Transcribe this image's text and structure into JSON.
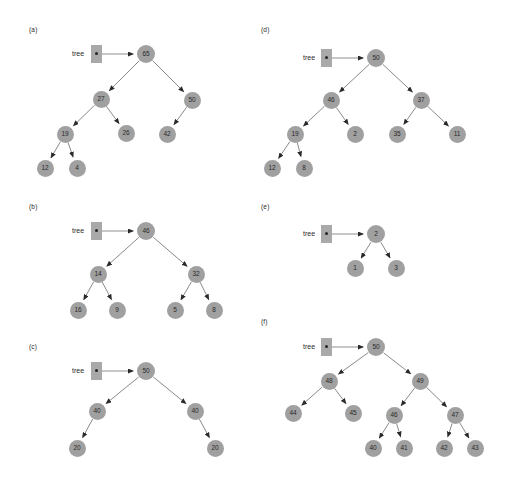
{
  "figure": {
    "background_color": "#ffffff",
    "node_color": "#a0a0a0",
    "node_text_color": "#2a2a2a",
    "edge_color": "#8a8a8a",
    "pointer_box_color": "#a9a9a9",
    "pointer_label": "tree"
  },
  "panels": [
    {
      "label": "(a)",
      "label_pos": [
        29,
        26
      ],
      "pointer": {
        "label": "tree",
        "label_pos": [
          72,
          50
        ],
        "box": [
          91,
          45,
          11,
          18
        ],
        "dot": [
          95,
          52
        ],
        "arrow_from": [
          102,
          54
        ],
        "arrow_to": [
          133,
          54
        ]
      },
      "nodes": [
        {
          "value": "65",
          "x": 146,
          "y": 54,
          "r": 9
        },
        {
          "value": "27",
          "x": 101,
          "y": 99,
          "r": 8.5
        },
        {
          "value": "50",
          "x": 192,
          "y": 100,
          "r": 8.5
        },
        {
          "value": "19",
          "x": 65,
          "y": 134,
          "r": 8.5
        },
        {
          "value": "26",
          "x": 126,
          "y": 133,
          "r": 8.5
        },
        {
          "value": "42",
          "x": 167,
          "y": 134,
          "r": 8.5
        },
        {
          "value": "12",
          "x": 45,
          "y": 168,
          "r": 8.5
        },
        {
          "value": "4",
          "x": 77,
          "y": 168,
          "r": 8.5
        }
      ],
      "edges": [
        [
          "65",
          "27"
        ],
        [
          "65",
          "50"
        ],
        [
          "27",
          "19"
        ],
        [
          "27",
          "26"
        ],
        [
          "50",
          "42"
        ],
        [
          "19",
          "12"
        ],
        [
          "19",
          "4"
        ]
      ]
    },
    {
      "label": "(b)",
      "label_pos": [
        29,
        203
      ],
      "pointer": {
        "label": "tree",
        "label_pos": [
          72,
          227
        ],
        "box": [
          91,
          222,
          11,
          18
        ],
        "dot": [
          95,
          229
        ],
        "arrow_from": [
          102,
          231
        ],
        "arrow_to": [
          133,
          231
        ]
      },
      "nodes": [
        {
          "value": "46",
          "x": 146,
          "y": 231,
          "r": 9
        },
        {
          "value": "14",
          "x": 98,
          "y": 274,
          "r": 8.5
        },
        {
          "value": "32",
          "x": 196,
          "y": 274,
          "r": 8.5
        },
        {
          "value": "16",
          "x": 78,
          "y": 310,
          "r": 8.5
        },
        {
          "value": "9",
          "x": 117,
          "y": 310,
          "r": 8.5
        },
        {
          "value": "5",
          "x": 175,
          "y": 310,
          "r": 8.5
        },
        {
          "value": "8",
          "x": 214,
          "y": 310,
          "r": 8.5
        }
      ],
      "edges": [
        [
          "46",
          "14"
        ],
        [
          "46",
          "32"
        ],
        [
          "14",
          "16"
        ],
        [
          "14",
          "9"
        ],
        [
          "32",
          "5"
        ],
        [
          "32",
          "8"
        ]
      ]
    },
    {
      "label": "(c)",
      "label_pos": [
        29,
        343
      ],
      "pointer": {
        "label": "tree",
        "label_pos": [
          72,
          367
        ],
        "box": [
          91,
          362,
          11,
          18
        ],
        "dot": [
          95,
          369
        ],
        "arrow_from": [
          102,
          371
        ],
        "arrow_to": [
          133,
          371
        ]
      },
      "nodes": [
        {
          "value": "50",
          "x": 146,
          "y": 371,
          "r": 9
        },
        {
          "value": "40",
          "x": 97,
          "y": 411,
          "r": 8.5
        },
        {
          "value": "40",
          "x": 195,
          "y": 411,
          "r": 8.5
        },
        {
          "value": "20",
          "x": 77,
          "y": 448,
          "r": 8.5
        },
        {
          "value": "20",
          "x": 215,
          "y": 448,
          "r": 8.5
        }
      ],
      "edges": [
        [
          "50",
          "40L"
        ],
        [
          "50",
          "40R"
        ],
        [
          "40L",
          "20L"
        ],
        [
          "40R",
          "20R"
        ]
      ]
    },
    {
      "label": "(d)",
      "label_pos": [
        261,
        26
      ],
      "pointer": {
        "label": "tree",
        "label_pos": [
          303,
          54
        ],
        "box": [
          321,
          49,
          11,
          18
        ],
        "dot": [
          325,
          56
        ],
        "arrow_from": [
          332,
          58
        ],
        "arrow_to": [
          363,
          58
        ]
      },
      "nodes": [
        {
          "value": "50",
          "x": 376,
          "y": 58,
          "r": 9
        },
        {
          "value": "46",
          "x": 331,
          "y": 100,
          "r": 8.5
        },
        {
          "value": "37",
          "x": 421,
          "y": 100,
          "r": 8.5
        },
        {
          "value": "19",
          "x": 295,
          "y": 134,
          "r": 8.5
        },
        {
          "value": "2",
          "x": 355,
          "y": 134,
          "r": 8.5
        },
        {
          "value": "35",
          "x": 397,
          "y": 134,
          "r": 8.5
        },
        {
          "value": "11",
          "x": 457,
          "y": 134,
          "r": 8.5
        },
        {
          "value": "12",
          "x": 272,
          "y": 168,
          "r": 8.5
        },
        {
          "value": "8",
          "x": 304,
          "y": 168,
          "r": 8.5
        }
      ],
      "edges": [
        [
          "50",
          "46"
        ],
        [
          "50",
          "37"
        ],
        [
          "46",
          "19"
        ],
        [
          "46",
          "2"
        ],
        [
          "37",
          "35"
        ],
        [
          "37",
          "11"
        ],
        [
          "19",
          "12"
        ],
        [
          "19",
          "8"
        ]
      ]
    },
    {
      "label": "(e)",
      "label_pos": [
        261,
        203
      ],
      "pointer": {
        "label": "tree",
        "label_pos": [
          303,
          230
        ],
        "box": [
          321,
          225,
          11,
          18
        ],
        "dot": [
          325,
          232
        ],
        "arrow_from": [
          332,
          234
        ],
        "arrow_to": [
          363,
          234
        ]
      },
      "nodes": [
        {
          "value": "2",
          "x": 376,
          "y": 234,
          "r": 9
        },
        {
          "value": "1",
          "x": 355,
          "y": 268,
          "r": 8.5
        },
        {
          "value": "3",
          "x": 396,
          "y": 268,
          "r": 8.5
        }
      ],
      "edges": [
        [
          "2",
          "1"
        ],
        [
          "2",
          "3"
        ]
      ]
    },
    {
      "label": "(f)",
      "label_pos": [
        261,
        318
      ],
      "pointer": {
        "label": "tree",
        "label_pos": [
          303,
          343
        ],
        "box": [
          321,
          338,
          11,
          18
        ],
        "dot": [
          325,
          345
        ],
        "arrow_from": [
          332,
          347
        ],
        "arrow_to": [
          363,
          347
        ]
      },
      "nodes": [
        {
          "value": "50",
          "x": 376,
          "y": 347,
          "r": 9
        },
        {
          "value": "48",
          "x": 329,
          "y": 381,
          "r": 8.5
        },
        {
          "value": "49",
          "x": 420,
          "y": 381,
          "r": 8.5
        },
        {
          "value": "44",
          "x": 293,
          "y": 413,
          "r": 8.5
        },
        {
          "value": "45",
          "x": 353,
          "y": 413,
          "r": 8.5
        },
        {
          "value": "46",
          "x": 394,
          "y": 415,
          "r": 8.5
        },
        {
          "value": "47",
          "x": 455,
          "y": 415,
          "r": 8.5
        },
        {
          "value": "40",
          "x": 373,
          "y": 448,
          "r": 8.5
        },
        {
          "value": "41",
          "x": 404,
          "y": 448,
          "r": 8.5
        },
        {
          "value": "42",
          "x": 444,
          "y": 448,
          "r": 8.5
        },
        {
          "value": "43",
          "x": 475,
          "y": 448,
          "r": 8.5
        }
      ],
      "edges": [
        [
          "50",
          "48"
        ],
        [
          "50",
          "49"
        ],
        [
          "48",
          "44"
        ],
        [
          "48",
          "45"
        ],
        [
          "49",
          "46"
        ],
        [
          "49",
          "47"
        ],
        [
          "46",
          "40"
        ],
        [
          "46",
          "41"
        ],
        [
          "47",
          "42"
        ],
        [
          "47",
          "43"
        ]
      ]
    }
  ]
}
